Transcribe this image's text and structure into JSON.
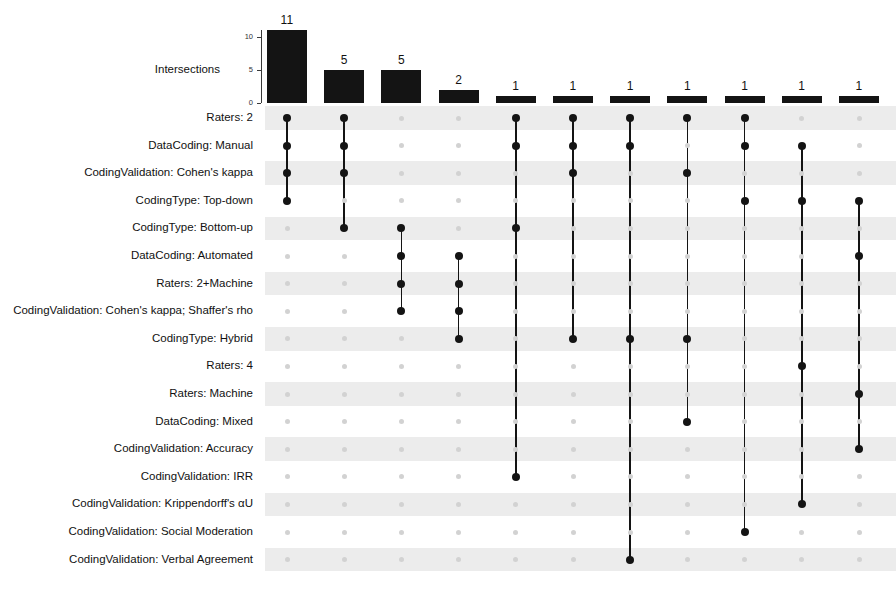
{
  "chart_data": {
    "type": "bar",
    "title": "",
    "subtitle": "",
    "xlabel": "",
    "ylabel": "Intersections",
    "ylim": [
      0,
      11
    ],
    "grid": false,
    "legend": null,
    "yticks": [
      "0",
      "5",
      "10"
    ],
    "ytick_values": [
      0,
      5,
      10
    ],
    "categories": [
      "set-1",
      "set-2",
      "set-3",
      "set-4",
      "set-5",
      "set-6",
      "set-7",
      "set-8",
      "set-9",
      "set-10",
      "set-11"
    ],
    "values": [
      11,
      5,
      5,
      2,
      1,
      1,
      1,
      1,
      1,
      1,
      1
    ],
    "value_labels": [
      "11",
      "5",
      "5",
      "2",
      "1",
      "1",
      "1",
      "1",
      "1",
      "1",
      "1"
    ],
    "set_names": [
      "Raters: 2",
      "DataCoding: Manual",
      "CodingValidation: Cohen's kappa",
      "CodingType: Top-down",
      "CodingType: Bottom-up",
      "DataCoding: Automated",
      "Raters: 2+Machine",
      "CodingValidation: Cohen's kappa; Shaffer's rho",
      "CodingType: Hybrid",
      "Raters: 4",
      "Raters: Machine",
      "DataCoding: Mixed",
      "CodingValidation: Accuracy",
      "CodingValidation: IRR",
      "CodingValidation: Krippendorff's αU",
      "CodingValidation: Social Moderation",
      "CodingValidation: Verbal Agreement"
    ],
    "intersections": [
      {
        "size": 11,
        "members": [
          0,
          1,
          2,
          3
        ]
      },
      {
        "size": 5,
        "members": [
          0,
          1,
          2,
          4
        ]
      },
      {
        "size": 5,
        "members": [
          4,
          5,
          6,
          7
        ]
      },
      {
        "size": 2,
        "members": [
          5,
          6,
          7,
          8
        ]
      },
      {
        "size": 1,
        "members": [
          0,
          1,
          4,
          13
        ]
      },
      {
        "size": 1,
        "members": [
          0,
          1,
          2,
          8
        ]
      },
      {
        "size": 1,
        "members": [
          0,
          1,
          8,
          16
        ]
      },
      {
        "size": 1,
        "members": [
          0,
          2,
          8,
          11
        ]
      },
      {
        "size": 1,
        "members": [
          0,
          1,
          3,
          15
        ]
      },
      {
        "size": 1,
        "members": [
          1,
          3,
          9,
          14
        ]
      },
      {
        "size": 1,
        "members": [
          3,
          5,
          10,
          12
        ]
      }
    ],
    "matrix": [
      [
        1,
        1,
        0,
        0,
        1,
        1,
        1,
        1,
        1,
        0,
        0
      ],
      [
        1,
        1,
        0,
        0,
        1,
        1,
        1,
        0,
        1,
        1,
        0
      ],
      [
        1,
        1,
        0,
        0,
        0,
        1,
        0,
        1,
        0,
        0,
        0
      ],
      [
        1,
        0,
        0,
        0,
        0,
        0,
        0,
        0,
        1,
        1,
        1
      ],
      [
        0,
        1,
        1,
        0,
        1,
        0,
        0,
        0,
        0,
        0,
        0
      ],
      [
        0,
        0,
        1,
        1,
        0,
        0,
        0,
        0,
        0,
        0,
        1
      ],
      [
        0,
        0,
        1,
        1,
        0,
        0,
        0,
        0,
        0,
        0,
        0
      ],
      [
        0,
        0,
        1,
        1,
        0,
        0,
        0,
        0,
        0,
        0,
        0
      ],
      [
        0,
        0,
        0,
        1,
        0,
        1,
        1,
        1,
        0,
        0,
        0
      ],
      [
        0,
        0,
        0,
        0,
        0,
        0,
        0,
        0,
        0,
        1,
        0
      ],
      [
        0,
        0,
        0,
        0,
        0,
        0,
        0,
        0,
        0,
        0,
        1
      ],
      [
        0,
        0,
        0,
        0,
        0,
        0,
        0,
        1,
        0,
        0,
        0
      ],
      [
        0,
        0,
        0,
        0,
        0,
        0,
        0,
        0,
        0,
        0,
        1
      ],
      [
        0,
        0,
        0,
        0,
        1,
        0,
        0,
        0,
        0,
        0,
        0
      ],
      [
        0,
        0,
        0,
        0,
        0,
        0,
        0,
        0,
        0,
        1,
        0
      ],
      [
        0,
        0,
        0,
        0,
        0,
        0,
        0,
        0,
        1,
        0,
        0
      ],
      [
        0,
        0,
        0,
        0,
        0,
        0,
        1,
        0,
        0,
        0,
        0
      ]
    ],
    "colors": {
      "bar": "#141414",
      "dot_on": "#141414",
      "dot_off": "#d2d2d2",
      "band": "#ececec",
      "axis": "#3a3a3a",
      "text": "#111111",
      "background": "#ffffff"
    }
  }
}
